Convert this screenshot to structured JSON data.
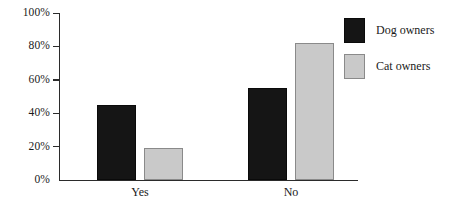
{
  "chart_data": {
    "type": "bar",
    "title": "",
    "subtitle": "",
    "xlabel": "",
    "ylabel": "",
    "categories": [
      "Yes",
      "No"
    ],
    "series": [
      {
        "name": "Dog owners",
        "color": "#151515",
        "values": [
          45,
          55
        ]
      },
      {
        "name": "Cat owners",
        "color": "#c9c9c9",
        "values": [
          19,
          82
        ]
      }
    ],
    "ylim": [
      0,
      100
    ],
    "y_ticks": [
      0,
      20,
      40,
      60,
      80,
      100
    ],
    "y_tick_labels": [
      "0%",
      "20%",
      "40%",
      "60%",
      "80%",
      "100%"
    ],
    "grid": false,
    "legend_position": "right",
    "annotations": []
  },
  "legend": {
    "entries": [
      {
        "label": "Dog owners",
        "swatch": "black-swatch"
      },
      {
        "label": "Cat owners",
        "swatch": "grey-swatch"
      }
    ]
  }
}
